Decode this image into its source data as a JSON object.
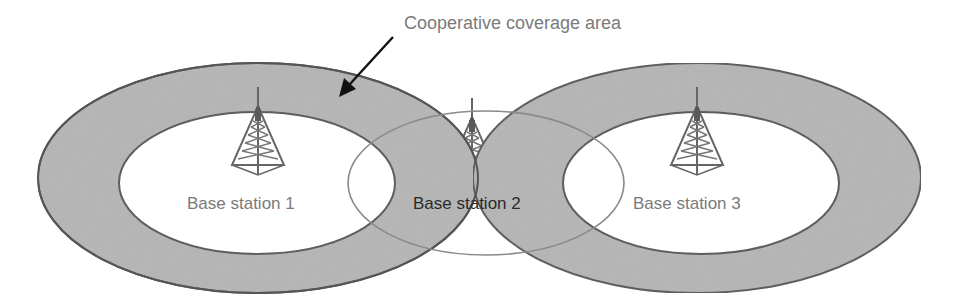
{
  "diagram": {
    "annotation": "Cooperative coverage area",
    "stations": [
      {
        "label": "Base station 1",
        "cx": 258,
        "cy": 178
      },
      {
        "label": "Base station 2",
        "cx": 486,
        "cy": 183
      },
      {
        "label": "Base station 3",
        "cx": 697,
        "cy": 178
      }
    ],
    "colors": {
      "ring_fill": "#b3b3b3",
      "ring_stroke": "#555555",
      "inner_fill": "#ffffff",
      "label_gray": "#7a7a7a",
      "label_dark": "#2a2a2a",
      "tower": "#6a6a6a",
      "arrow": "#111111"
    },
    "icons": [
      "tower-icon",
      "arrow-icon"
    ]
  }
}
